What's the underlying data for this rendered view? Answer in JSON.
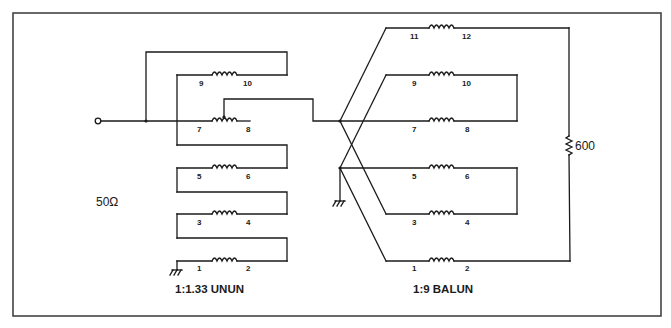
{
  "diagram": {
    "unun": {
      "title": "1:1.33 UNUN",
      "impedance_label": "50Ω",
      "windings": [
        {
          "start": "9",
          "end": "10"
        },
        {
          "start": "7",
          "end": "8"
        },
        {
          "start": "5",
          "end": "6"
        },
        {
          "start": "3",
          "end": "4"
        },
        {
          "start": "1",
          "end": "2"
        }
      ]
    },
    "balun": {
      "title": "1:9 BALUN",
      "windings": [
        {
          "start": "11",
          "end": "12"
        },
        {
          "start": "9",
          "end": "10"
        },
        {
          "start": "7",
          "end": "8"
        },
        {
          "start": "5",
          "end": "6"
        },
        {
          "start": "3",
          "end": "4"
        },
        {
          "start": "1",
          "end": "2"
        }
      ],
      "load_label": "600"
    },
    "icons": [
      "input-terminal-icon",
      "ground-icon",
      "inductor-icon",
      "resistor-icon",
      "junction-dot-icon"
    ]
  }
}
